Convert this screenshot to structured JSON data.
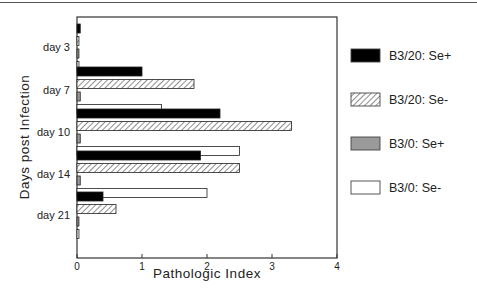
{
  "chart_data": {
    "type": "bar",
    "orientation": "horizontal",
    "title": "",
    "xlabel": "Pathologic Index",
    "ylabel": "Days post Infection",
    "xlim": [
      0,
      4
    ],
    "xticks": [
      "0",
      "1",
      "2",
      "3",
      "4"
    ],
    "categories": [
      "day 3",
      "day 7",
      "day 10",
      "day 14",
      "day 21"
    ],
    "series": [
      {
        "name": "B3/20: Se+",
        "pattern": "solid-black",
        "values": [
          0.05,
          1.0,
          2.2,
          1.9,
          0.4
        ]
      },
      {
        "name": "B3/20: Se-",
        "pattern": "diagonal-hatch",
        "values": [
          0.03,
          1.8,
          3.3,
          2.5,
          0.6
        ]
      },
      {
        "name": "B3/0: Se+",
        "pattern": "solid-grey",
        "values": [
          0.03,
          0.05,
          0.05,
          0.05,
          0.03
        ]
      },
      {
        "name": "B3/0: Se-",
        "pattern": "white",
        "values": [
          0.03,
          1.3,
          2.5,
          2.0,
          0.03
        ]
      }
    ],
    "grid": false,
    "legend_position": "right"
  }
}
